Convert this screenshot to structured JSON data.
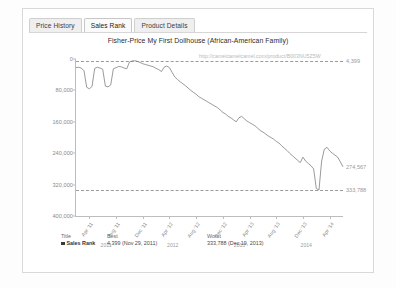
{
  "tabs": [
    {
      "label": "Price History",
      "active": false
    },
    {
      "label": "Sales Rank",
      "active": true
    },
    {
      "label": "Product Details",
      "active": false
    }
  ],
  "chart_header": {
    "title": "Fisher-Price My First Dollhouse (African-American Family)",
    "watermark": "http://camelcamelcamel.com/product/B003NU5Z5W"
  },
  "legend": {
    "headers": {
      "title": "Title",
      "best": "Best",
      "worst": "Worst"
    },
    "rows": [
      {
        "name": "Sales Rank",
        "best": "4,399 (Nov 29, 2011)",
        "worst": "333,788 (Dec 19, 2013)",
        "color": "#3a3a3a"
      }
    ]
  },
  "chart_data": {
    "type": "line",
    "title": "Fisher-Price My First Dollhouse (African-American Family)",
    "xlabel": "",
    "ylabel": "Sales Rank",
    "ylim": [
      0,
      400000
    ],
    "y_inverted": true,
    "grid": false,
    "legend_position": "bottom",
    "series_color": "#808080",
    "yticks": [
      0,
      80000,
      160000,
      240000,
      320000,
      400000
    ],
    "ytick_labels": [
      "0",
      "80,000",
      "160,000",
      "240,000",
      "320,000",
      "400,000"
    ],
    "xtick_labels": [
      "Apr '11",
      "Aug '11",
      "Dec '11",
      "Apr '12",
      "Aug '12",
      "Dec '12",
      "Apr '13",
      "Aug '13",
      "Dec '13",
      "Apr '14"
    ],
    "year_labels": [
      "2011",
      "2012",
      "2013",
      "2014"
    ],
    "reference_lines": [
      {
        "value": 4399,
        "label": "4,399",
        "style": "dashed"
      },
      {
        "value": 333788,
        "label": "333,788",
        "style": "dashed"
      }
    ],
    "current_marker": {
      "value": 274567,
      "label": "274,567"
    },
    "series": [
      {
        "name": "Sales Rank",
        "x": [
          0,
          1,
          2,
          3,
          4,
          5,
          6,
          7,
          8,
          9,
          10,
          11,
          12,
          13,
          14,
          15,
          16,
          17,
          18,
          19,
          20,
          21,
          22,
          23,
          24,
          25,
          26,
          27,
          28,
          29,
          30,
          31,
          32,
          33,
          34,
          35,
          36,
          37,
          38,
          39,
          40,
          41,
          42,
          43,
          44,
          45,
          46,
          47,
          48,
          49,
          50,
          51,
          52,
          53,
          54,
          55,
          56,
          57,
          58,
          59,
          60,
          61,
          62,
          63,
          64,
          65,
          66,
          67,
          68,
          69,
          70,
          71,
          72,
          73,
          74,
          75,
          76,
          77,
          78,
          79,
          80,
          81,
          82,
          83,
          84,
          85,
          86,
          87,
          88,
          89,
          90,
          91,
          92,
          93,
          94,
          95,
          96,
          97,
          98,
          99,
          100
        ],
        "values": [
          22000,
          21000,
          23000,
          30000,
          72000,
          76000,
          70000,
          24000,
          21000,
          23000,
          26000,
          69000,
          71000,
          66000,
          25000,
          22000,
          19000,
          20000,
          23000,
          25000,
          8000,
          5000,
          4399,
          6000,
          9000,
          12000,
          14000,
          16000,
          18000,
          20000,
          24000,
          27000,
          32000,
          21000,
          18000,
          22000,
          34000,
          46000,
          52000,
          58000,
          63000,
          68000,
          74000,
          80000,
          85000,
          90000,
          96000,
          100000,
          104000,
          108000,
          112000,
          116000,
          120000,
          124000,
          130000,
          136000,
          140000,
          146000,
          150000,
          155000,
          160000,
          150000,
          146000,
          152000,
          158000,
          162000,
          166000,
          170000,
          176000,
          182000,
          186000,
          191000,
          196000,
          200000,
          204000,
          210000,
          214000,
          221000,
          227000,
          233000,
          240000,
          246000,
          252000,
          258000,
          264000,
          250000,
          260000,
          266000,
          272000,
          280000,
          330000,
          333788,
          260000,
          230000,
          225000,
          234000,
          240000,
          245000,
          250000,
          262000,
          274567
        ],
        "color": "#808080"
      }
    ]
  }
}
